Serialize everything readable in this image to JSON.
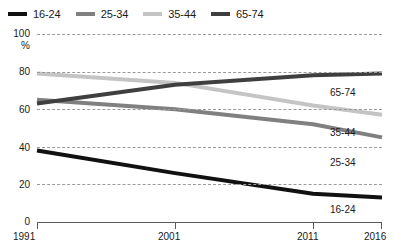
{
  "legend": {
    "items": [
      {
        "label": "16-24",
        "color": "#111111"
      },
      {
        "label": "25-34",
        "color": "#808080"
      },
      {
        "label": "35-44",
        "color": "#c4c4c4"
      },
      {
        "label": "65-74",
        "color": "#3f3f3f"
      }
    ]
  },
  "axes": {
    "y_unit": "%",
    "y_ticks": [
      "100",
      "80",
      "60",
      "40",
      "20",
      "0"
    ],
    "x_ticks": [
      "1991",
      "2001",
      "2011",
      "2016"
    ]
  },
  "inline_labels": [
    {
      "name": "65-74"
    },
    {
      "name": "35-44"
    },
    {
      "name": "25-34"
    },
    {
      "name": "16-24"
    }
  ],
  "chart_data": {
    "type": "line",
    "title": "",
    "subtitle": "",
    "xlabel": "",
    "ylabel": "%",
    "xlim": [
      1991,
      2016
    ],
    "ylim": [
      0,
      100
    ],
    "yticks": [
      0,
      20,
      40,
      60,
      80,
      100
    ],
    "xticks": [
      1991,
      2001,
      2011,
      2016
    ],
    "grid": "horizontal-dashed",
    "legend_position": "top-left",
    "x": [
      1991,
      2001,
      2011,
      2016
    ],
    "series": [
      {
        "name": "16-24",
        "color": "#111111",
        "values": [
          38,
          26,
          15,
          13
        ]
      },
      {
        "name": "25-34",
        "color": "#808080",
        "values": [
          65,
          60,
          52,
          45
        ]
      },
      {
        "name": "35-44",
        "color": "#c4c4c4",
        "values": [
          79,
          74,
          62,
          57
        ]
      },
      {
        "name": "65-74",
        "color": "#3f3f3f",
        "values": [
          63,
          73,
          78,
          79
        ]
      }
    ]
  }
}
